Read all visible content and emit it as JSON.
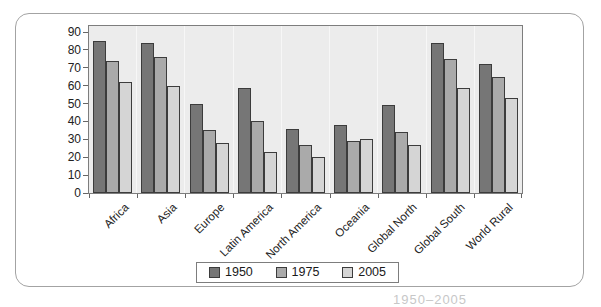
{
  "chart_data": {
    "type": "bar",
    "title": "",
    "categories": [
      "Africa",
      "Asia",
      "Europe",
      "Latin America",
      "North America",
      "Oceania",
      "Global North",
      "Global South",
      "World Rural"
    ],
    "series": [
      {
        "name": "1950",
        "color": "#767676",
        "values": [
          85,
          84,
          50,
          59,
          36,
          38,
          49,
          84,
          72
        ]
      },
      {
        "name": "1975",
        "color": "#aaaaaa",
        "values": [
          74,
          76,
          35,
          40,
          27,
          29,
          34,
          75,
          65
        ]
      },
      {
        "name": "2005",
        "color": "#d5d5d5",
        "values": [
          62,
          60,
          28,
          23,
          20,
          30,
          27,
          59,
          53
        ]
      }
    ],
    "xlabel": "",
    "ylabel": "",
    "ylim": [
      0,
      90
    ],
    "yticks": [
      0,
      10,
      20,
      30,
      40,
      50,
      60,
      70,
      80,
      90
    ],
    "grid": "vertical-category-separators",
    "legend_position": "bottom"
  },
  "caption_fragment": "1950–2005",
  "colors": {
    "plot_bg": "#ececec",
    "plot_border": "#7d7d7d",
    "bar_border": "#3c3c3c",
    "card_border": "#a3a3a3",
    "axis_text": "#222222"
  }
}
